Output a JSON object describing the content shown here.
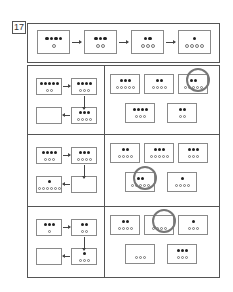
{
  "problem_number": "17",
  "example_sequence": [
    {
      "filled": 4,
      "empty": 1
    },
    {
      "filled": 3,
      "empty": 2
    },
    {
      "filled": 2,
      "empty": 3
    },
    {
      "filled": 1,
      "empty": 4
    }
  ],
  "rows": [
    {
      "sequence": [
        {
          "filled": 5,
          "empty": 2
        },
        {
          "filled": 4,
          "empty": 3
        },
        {
          "filled": 3,
          "empty": 4
        },
        {
          "filled": null,
          "empty": null
        }
      ],
      "options": [
        {
          "filled": 3,
          "empty": 5,
          "circled": false
        },
        {
          "filled": 2,
          "empty": 4,
          "circled": false
        },
        {
          "filled": 2,
          "empty": 5,
          "circled": true
        },
        {
          "filled": 4,
          "empty": 3,
          "circled": false
        },
        {
          "filled": 2,
          "empty": 2,
          "circled": false
        }
      ]
    },
    {
      "sequence": [
        {
          "filled": 4,
          "empty": 3
        },
        {
          "filled": 3,
          "empty": 4
        },
        {
          "filled": null,
          "empty": null
        },
        {
          "filled": 1,
          "empty": 6
        }
      ],
      "options": [
        {
          "filled": 2,
          "empty": 4,
          "circled": false
        },
        {
          "filled": 3,
          "empty": 5,
          "circled": false
        },
        {
          "filled": 3,
          "empty": 3,
          "circled": false
        },
        {
          "filled": 2,
          "empty": 5,
          "circled": true
        },
        {
          "filled": 1,
          "empty": 4,
          "circled": false
        }
      ]
    },
    {
      "sequence": [
        {
          "filled": 3,
          "empty": 1
        },
        {
          "filled": 2,
          "empty": 2
        },
        {
          "filled": 1,
          "empty": 3
        },
        {
          "filled": null,
          "empty": null
        }
      ],
      "options": [
        {
          "filled": 2,
          "empty": 4,
          "circled": false
        },
        {
          "filled": 0,
          "empty": 4,
          "circled": true
        },
        {
          "filled": 1,
          "empty": 3,
          "circled": false
        },
        {
          "filled": 0,
          "empty": 3,
          "circled": false
        },
        {
          "filled": 3,
          "empty": 3,
          "circled": false
        }
      ]
    }
  ]
}
